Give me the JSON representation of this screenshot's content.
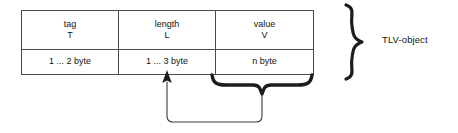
{
  "diagram": {
    "background_color": "#ffffff",
    "line_color": "#4a4a4a",
    "text_color": "#141414",
    "brace_color": "#1c1c1c"
  },
  "table": {
    "columns": [
      {
        "name": "tag",
        "letter": "T",
        "size": "1 ... 2 byte"
      },
      {
        "name": "length",
        "letter": "L",
        "size": "1 ... 3 byte"
      },
      {
        "name": "value",
        "letter": "V",
        "size": "n byte"
      }
    ]
  },
  "annotations": {
    "object_label": "TLV-object",
    "value_brace": {
      "spans_column": "value",
      "points_to_column": "length"
    }
  }
}
